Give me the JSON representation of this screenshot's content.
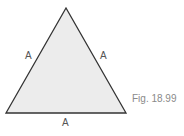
{
  "figure": {
    "caption": "Fig. 18.99",
    "shape": "equilateral-triangle",
    "fill_color": "#ececec",
    "stroke_color": "#333333",
    "side_labels": {
      "left": "A",
      "right": "A",
      "bottom": "A"
    }
  }
}
